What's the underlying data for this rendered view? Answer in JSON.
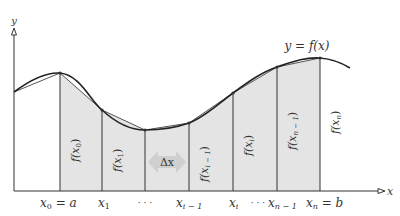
{
  "diagram": {
    "type": "riemann-trapezoid-approximation",
    "colors": {
      "background": "#ffffff",
      "fill": "#e4e4e4",
      "stroke": "#333333",
      "curve": "#222222",
      "delta_arrow": "#cfcfcf",
      "text": "#333333"
    },
    "axis": {
      "y_label": "y",
      "x_label": "x"
    },
    "curve_label": "y = f(x)",
    "delta_label": "Δx",
    "partition_points": [
      {
        "x": 60,
        "y": 73,
        "tick_label": "x₀ = a",
        "height_label": "f(x₀)"
      },
      {
        "x": 102,
        "y": 110,
        "tick_label": "x₁",
        "height_label": "f(x₁)"
      },
      {
        "x": 145,
        "y": 130,
        "tick_label": "⋯",
        "height_label": ""
      },
      {
        "x": 189,
        "y": 123,
        "tick_label": "xᵢ ₋ ₁",
        "height_label": "f(xᵢ ₋ ₁)"
      },
      {
        "x": 233,
        "y": 93,
        "tick_label": "xᵢ",
        "height_label": "f(xᵢ)"
      },
      {
        "x": 277,
        "y": 67,
        "tick_label": "⋯ xₙ ₋ ₁",
        "height_label": "f(xₙ ₋ ₁)"
      },
      {
        "x": 320,
        "y": 58,
        "tick_label": "xₙ = b",
        "height_label": "f(xₙ)"
      }
    ],
    "tick_labels": {
      "x0": "x",
      "x0_sub": "0",
      "x0_eq": " = a",
      "x1": "x",
      "x1_sub": "1",
      "dots1": "· · ·",
      "xim1": "x",
      "xim1_sub": "i − 1",
      "xi": "x",
      "xi_sub": "i",
      "dots2": "· · ·",
      "xnm1": "x",
      "xnm1_sub": "n − 1",
      "xn": "x",
      "xn_sub": "n",
      "xn_eq": " = b"
    },
    "height_labels": {
      "f0": "f(x",
      "f0_sub": "0",
      "f1": "f(x",
      "f1_sub": "1",
      "fim1": "f(x",
      "fim1_sub": "i − 1",
      "fi": "f(x",
      "fi_sub": "i",
      "fnm1": "f(x",
      "fnm1_sub": "n − 1",
      "fn": "f(x",
      "fn_sub": "n",
      "close": ")"
    }
  }
}
